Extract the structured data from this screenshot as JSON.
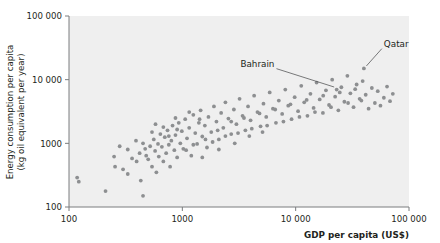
{
  "chart_data": {
    "type": "scatter",
    "title": "",
    "xlabel": "GDP per capita (US$)",
    "ylabel": "Energy consumption per capita (kg oil equivalent per year)",
    "ylabel_line1": "Energy consumption per capita",
    "ylabel_line2": "(kg oil equivalent per year)",
    "xscale": "log",
    "yscale": "log",
    "xlim": [
      100,
      100000
    ],
    "ylim": [
      100,
      100000
    ],
    "xticks": [
      100,
      1000,
      10000,
      100000
    ],
    "xtick_labels": [
      "100",
      "1000",
      "10 000",
      "100 000"
    ],
    "yticks": [
      100,
      1000,
      10000,
      100000
    ],
    "ytick_labels": [
      "100",
      "1000",
      "10 000",
      "100 000"
    ],
    "grid": false,
    "legend": null,
    "marker_color": "#8d8f91",
    "plot_background": "#efefef",
    "axis_color": "#7a7c7e",
    "annotations": [
      {
        "label": "Qatar",
        "x": 40000,
        "y": 15000,
        "text_x": 60000,
        "text_y": 33000
      },
      {
        "label": "Bahrain",
        "x": 23000,
        "y": 7000,
        "text_x": 6500,
        "text_y": 16000
      }
    ],
    "points": [
      {
        "x": 118,
        "y": 290
      },
      {
        "x": 122,
        "y": 250
      },
      {
        "x": 210,
        "y": 178
      },
      {
        "x": 255,
        "y": 430
      },
      {
        "x": 300,
        "y": 390
      },
      {
        "x": 330,
        "y": 330
      },
      {
        "x": 360,
        "y": 580
      },
      {
        "x": 395,
        "y": 520
      },
      {
        "x": 420,
        "y": 700
      },
      {
        "x": 430,
        "y": 260
      },
      {
        "x": 450,
        "y": 150
      },
      {
        "x": 470,
        "y": 820
      },
      {
        "x": 480,
        "y": 640
      },
      {
        "x": 500,
        "y": 560
      },
      {
        "x": 520,
        "y": 900
      },
      {
        "x": 540,
        "y": 430
      },
      {
        "x": 560,
        "y": 1150
      },
      {
        "x": 575,
        "y": 760
      },
      {
        "x": 590,
        "y": 350
      },
      {
        "x": 610,
        "y": 980
      },
      {
        "x": 620,
        "y": 620
      },
      {
        "x": 640,
        "y": 1400
      },
      {
        "x": 660,
        "y": 880
      },
      {
        "x": 680,
        "y": 520
      },
      {
        "x": 700,
        "y": 1250
      },
      {
        "x": 720,
        "y": 700
      },
      {
        "x": 740,
        "y": 1600
      },
      {
        "x": 760,
        "y": 950
      },
      {
        "x": 780,
        "y": 430
      },
      {
        "x": 800,
        "y": 1100
      },
      {
        "x": 820,
        "y": 1900
      },
      {
        "x": 850,
        "y": 780
      },
      {
        "x": 870,
        "y": 1350
      },
      {
        "x": 900,
        "y": 600
      },
      {
        "x": 930,
        "y": 2100
      },
      {
        "x": 960,
        "y": 1000
      },
      {
        "x": 990,
        "y": 1550
      },
      {
        "x": 1020,
        "y": 820
      },
      {
        "x": 1060,
        "y": 2400
      },
      {
        "x": 1100,
        "y": 1200
      },
      {
        "x": 1150,
        "y": 1750
      },
      {
        "x": 1200,
        "y": 640
      },
      {
        "x": 1250,
        "y": 2800
      },
      {
        "x": 1300,
        "y": 1450
      },
      {
        "x": 1350,
        "y": 980
      },
      {
        "x": 1400,
        "y": 2100
      },
      {
        "x": 1450,
        "y": 3300
      },
      {
        "x": 1500,
        "y": 1280
      },
      {
        "x": 1580,
        "y": 1900
      },
      {
        "x": 1650,
        "y": 860
      },
      {
        "x": 1700,
        "y": 2600
      },
      {
        "x": 1800,
        "y": 1500
      },
      {
        "x": 1900,
        "y": 3800
      },
      {
        "x": 2000,
        "y": 2200
      },
      {
        "x": 2100,
        "y": 1150
      },
      {
        "x": 2200,
        "y": 3000
      },
      {
        "x": 2300,
        "y": 1750
      },
      {
        "x": 2400,
        "y": 4400
      },
      {
        "x": 2550,
        "y": 2450
      },
      {
        "x": 2700,
        "y": 1400
      },
      {
        "x": 2850,
        "y": 3400
      },
      {
        "x": 3000,
        "y": 2000
      },
      {
        "x": 3200,
        "y": 5000
      },
      {
        "x": 3400,
        "y": 2700
      },
      {
        "x": 3600,
        "y": 1600
      },
      {
        "x": 3800,
        "y": 3800
      },
      {
        "x": 4000,
        "y": 2300
      },
      {
        "x": 4300,
        "y": 5600
      },
      {
        "x": 4600,
        "y": 3100
      },
      {
        "x": 4900,
        "y": 1850
      },
      {
        "x": 5200,
        "y": 4200
      },
      {
        "x": 5500,
        "y": 2600
      },
      {
        "x": 5900,
        "y": 6300
      },
      {
        "x": 6300,
        "y": 3500
      },
      {
        "x": 6700,
        "y": 2100
      },
      {
        "x": 7100,
        "y": 4700
      },
      {
        "x": 7600,
        "y": 2900
      },
      {
        "x": 8100,
        "y": 7000
      },
      {
        "x": 8600,
        "y": 3900
      },
      {
        "x": 9200,
        "y": 2400
      },
      {
        "x": 9800,
        "y": 5300
      },
      {
        "x": 10500,
        "y": 3200
      },
      {
        "x": 11200,
        "y": 8000
      },
      {
        "x": 11900,
        "y": 4400
      },
      {
        "x": 12700,
        "y": 2700
      },
      {
        "x": 13500,
        "y": 6000
      },
      {
        "x": 14400,
        "y": 3600
      },
      {
        "x": 15300,
        "y": 9000
      },
      {
        "x": 16300,
        "y": 4900
      },
      {
        "x": 17400,
        "y": 3000
      },
      {
        "x": 18500,
        "y": 6800
      },
      {
        "x": 19700,
        "y": 4000
      },
      {
        "x": 21000,
        "y": 10000
      },
      {
        "x": 22300,
        "y": 5400
      },
      {
        "x": 23000,
        "y": 7000
      },
      {
        "x": 23800,
        "y": 3300
      },
      {
        "x": 25300,
        "y": 7600
      },
      {
        "x": 26900,
        "y": 4500
      },
      {
        "x": 28600,
        "y": 11500
      },
      {
        "x": 30400,
        "y": 6100
      },
      {
        "x": 32400,
        "y": 3700
      },
      {
        "x": 34500,
        "y": 8400
      },
      {
        "x": 36700,
        "y": 5000
      },
      {
        "x": 39000,
        "y": 9500
      },
      {
        "x": 40000,
        "y": 15000
      },
      {
        "x": 41500,
        "y": 5800
      },
      {
        "x": 44000,
        "y": 3500
      },
      {
        "x": 47000,
        "y": 7400
      },
      {
        "x": 50000,
        "y": 4300
      },
      {
        "x": 53000,
        "y": 6600
      },
      {
        "x": 56000,
        "y": 3900
      },
      {
        "x": 60000,
        "y": 5200
      },
      {
        "x": 64000,
        "y": 7800
      },
      {
        "x": 68000,
        "y": 4600
      },
      {
        "x": 72000,
        "y": 6000
      },
      {
        "x": 450,
        "y": 1000
      },
      {
        "x": 540,
        "y": 1500
      },
      {
        "x": 680,
        "y": 1800
      },
      {
        "x": 760,
        "y": 1300
      },
      {
        "x": 900,
        "y": 1650
      },
      {
        "x": 1080,
        "y": 780
      },
      {
        "x": 1250,
        "y": 950
      },
      {
        "x": 1420,
        "y": 2400
      },
      {
        "x": 1600,
        "y": 1150
      },
      {
        "x": 1850,
        "y": 1050
      },
      {
        "x": 2050,
        "y": 1600
      },
      {
        "x": 2400,
        "y": 1300
      },
      {
        "x": 2700,
        "y": 2200
      },
      {
        "x": 3100,
        "y": 1450
      },
      {
        "x": 3500,
        "y": 2500
      },
      {
        "x": 4100,
        "y": 1700
      },
      {
        "x": 4800,
        "y": 2950
      },
      {
        "x": 5600,
        "y": 1900
      },
      {
        "x": 6600,
        "y": 3400
      },
      {
        "x": 7800,
        "y": 2200
      },
      {
        "x": 9000,
        "y": 4100
      },
      {
        "x": 10800,
        "y": 2600
      },
      {
        "x": 12500,
        "y": 4800
      },
      {
        "x": 14800,
        "y": 3100
      },
      {
        "x": 17500,
        "y": 5600
      },
      {
        "x": 20500,
        "y": 3700
      },
      {
        "x": 24500,
        "y": 6300
      },
      {
        "x": 29000,
        "y": 4300
      },
      {
        "x": 33500,
        "y": 7100
      },
      {
        "x": 38000,
        "y": 4700
      },
      {
        "x": 580,
        "y": 2000
      },
      {
        "x": 870,
        "y": 2500
      },
      {
        "x": 1150,
        "y": 3100
      },
      {
        "x": 1500,
        "y": 600
      },
      {
        "x": 2100,
        "y": 800
      },
      {
        "x": 2900,
        "y": 1000
      },
      {
        "x": 3900,
        "y": 1300
      },
      {
        "x": 5100,
        "y": 1500
      },
      {
        "x": 330,
        "y": 800
      },
      {
        "x": 390,
        "y": 1100
      },
      {
        "x": 250,
        "y": 620
      },
      {
        "x": 280,
        "y": 900
      }
    ]
  }
}
